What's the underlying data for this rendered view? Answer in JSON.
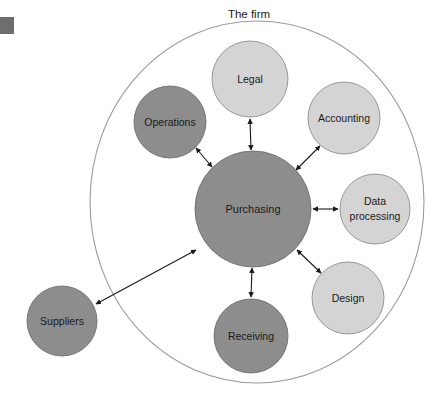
{
  "figure": {
    "title": "The firm",
    "caption_position": "top-center",
    "background_color": "#ffffff"
  },
  "corner_marker": {
    "name": "figure-number-block",
    "color": "#6e6e6e",
    "x": 0,
    "y": 17,
    "width": 14,
    "height": 17
  },
  "boundary": {
    "label": "The firm",
    "shape": "ellipse",
    "cx": 257,
    "cy": 202,
    "rx": 167,
    "ry": 181,
    "stroke": "#9a9a9a",
    "fill": "none"
  },
  "colors": {
    "dark_node": "#8d8d8d",
    "light_node": "#d4d4d4",
    "node_stroke": "#6f6f6f",
    "arrow": "#1a1a1a",
    "text": "#1a1a1a",
    "boundary_stroke": "#9a9a9a"
  },
  "center_node": {
    "id": "purchasing",
    "label": "Purchasing",
    "cx": 253,
    "cy": 209,
    "r": 58,
    "fill": "#8d8d8d",
    "font_size": 11,
    "inside_firm": true
  },
  "nodes": [
    {
      "id": "legal",
      "label": "Legal",
      "lines": [
        "Legal"
      ],
      "cx": 250,
      "cy": 79,
      "r": 38,
      "fill": "#d4d4d4",
      "font_size": 10.5,
      "inside_firm": true
    },
    {
      "id": "operations",
      "label": "Operations",
      "lines": [
        "Operations"
      ],
      "cx": 170,
      "cy": 122,
      "r": 36,
      "fill": "#8d8d8d",
      "font_size": 10.5,
      "inside_firm": true
    },
    {
      "id": "accounting",
      "label": "Accounting",
      "lines": [
        "Accounting"
      ],
      "cx": 344,
      "cy": 118,
      "r": 36,
      "fill": "#d4d4d4",
      "font_size": 10.5,
      "inside_firm": true
    },
    {
      "id": "data-processing",
      "label": "Data processing",
      "lines": [
        "Data",
        "processing"
      ],
      "cx": 375,
      "cy": 209,
      "r": 35,
      "fill": "#d4d4d4",
      "font_size": 10.5,
      "inside_firm": true
    },
    {
      "id": "design",
      "label": "Design",
      "lines": [
        "Design"
      ],
      "cx": 348,
      "cy": 298,
      "r": 36,
      "fill": "#d4d4d4",
      "font_size": 10.5,
      "inside_firm": true
    },
    {
      "id": "receiving",
      "label": "Receiving",
      "lines": [
        "Receiving"
      ],
      "cx": 251,
      "cy": 336,
      "r": 37,
      "fill": "#8d8d8d",
      "font_size": 10.5,
      "inside_firm": true
    },
    {
      "id": "suppliers",
      "label": "Suppliers",
      "lines": [
        "Suppliers"
      ],
      "cx": 62,
      "cy": 321,
      "r": 35,
      "fill": "#8d8d8d",
      "font_size": 10.5,
      "inside_firm": false
    }
  ],
  "connections": [
    {
      "from": "purchasing",
      "to": "legal",
      "style": "double-arrow"
    },
    {
      "from": "purchasing",
      "to": "operations",
      "style": "double-arrow"
    },
    {
      "from": "purchasing",
      "to": "accounting",
      "style": "double-arrow"
    },
    {
      "from": "purchasing",
      "to": "data-processing",
      "style": "double-arrow"
    },
    {
      "from": "purchasing",
      "to": "design",
      "style": "double-arrow"
    },
    {
      "from": "purchasing",
      "to": "receiving",
      "style": "double-arrow"
    },
    {
      "from": "purchasing",
      "to": "suppliers",
      "style": "double-arrow"
    }
  ]
}
